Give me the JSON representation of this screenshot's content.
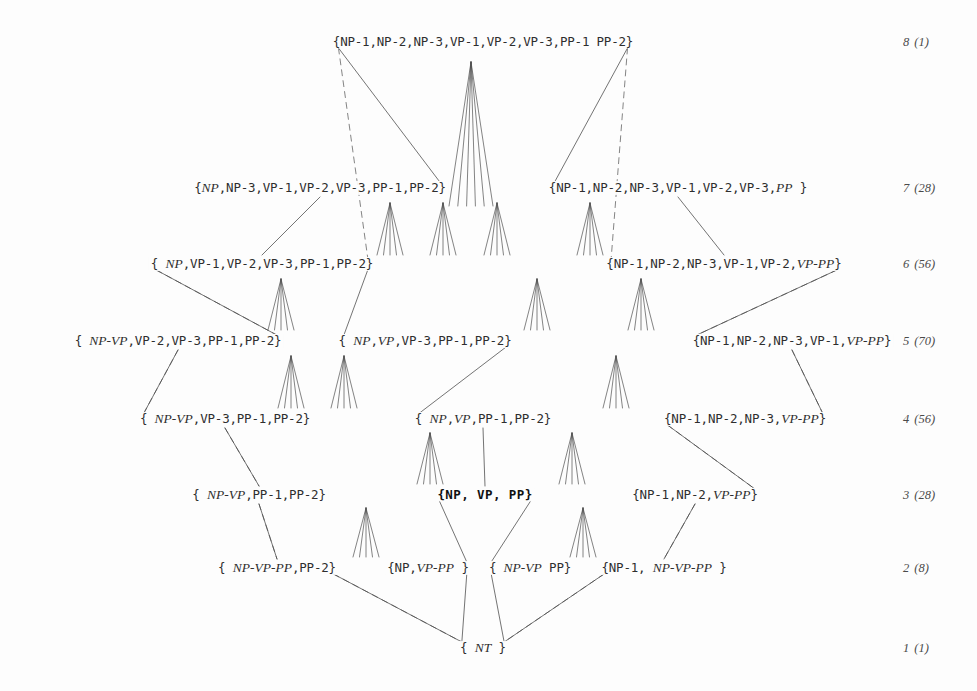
{
  "diagram": {
    "width": 977,
    "height": 691,
    "background": "#fdfdfd",
    "edge_color": "#4a4a4a",
    "fan_color": "#3a3a3a",
    "levels": [
      {
        "id": "l8",
        "number": "8",
        "count": "(1)",
        "y": 42
      },
      {
        "id": "l7",
        "number": "7",
        "count": "(28)",
        "y": 188
      },
      {
        "id": "l6",
        "number": "6",
        "count": "(56)",
        "y": 264
      },
      {
        "id": "l5",
        "number": "5",
        "count": "(70)",
        "y": 341
      },
      {
        "id": "l4",
        "number": "4",
        "count": "(56)",
        "y": 419
      },
      {
        "id": "l3",
        "number": "3",
        "count": "(28)",
        "y": 495
      },
      {
        "id": "l2",
        "number": "2",
        "count": "(8)",
        "y": 568
      },
      {
        "id": "l1",
        "number": "1",
        "count": "(1)",
        "y": 648
      }
    ],
    "level_label_x": 903,
    "nodes": [
      {
        "id": "n8",
        "x": 483,
        "y": 42,
        "level": 8,
        "bold": false,
        "html": "{NP-1,NP-2,NP-3,VP-1,VP-2,VP-3,PP-1 PP-2}",
        "text": "{NP-1,NP-2,NP-3,VP-1,VP-2,VP-3,PP-1 PP-2}"
      },
      {
        "id": "n7a",
        "x": 320,
        "y": 188,
        "level": 7,
        "bold": false,
        "html": "{<span class=\"it\">NP</span>,NP-3,VP-1,VP-2,VP-3,PP-1,PP-2}",
        "text": "{NP,NP-3,VP-1,VP-2,VP-3,PP-1,PP-2}"
      },
      {
        "id": "n7b",
        "x": 678,
        "y": 188,
        "level": 7,
        "bold": false,
        "html": "{NP-1,NP-2,NP-3,VP-1,VP-2,VP-3,<span class=\"it\">PP</span> }",
        "text": "{NP-1,NP-2,NP-3,VP-1,VP-2,VP-3,PP }"
      },
      {
        "id": "n6a",
        "x": 262,
        "y": 264,
        "level": 6,
        "bold": false,
        "html": "{ <span class=\"it\">NP</span>,VP-1,VP-2,VP-3,PP-1,PP-2}",
        "text": "{ NP,VP-1,VP-2,VP-3,PP-1,PP-2}"
      },
      {
        "id": "n6b",
        "x": 724,
        "y": 264,
        "level": 6,
        "bold": false,
        "html": "{NP-1,NP-2,NP-3,VP-1,VP-2,<span class=\"it\">VP-PP</span>}",
        "text": "{NP-1,NP-2,NP-3,VP-1,VP-2,VP-PP}"
      },
      {
        "id": "n5a",
        "x": 178,
        "y": 341,
        "level": 5,
        "bold": false,
        "html": "{ <span class=\"it\">NP-VP</span>,VP-2,VP-3,PP-1,PP-2}",
        "text": "{ NP-VP,VP-2,VP-3,PP-1,PP-2}"
      },
      {
        "id": "n5b",
        "x": 425,
        "y": 341,
        "level": 5,
        "bold": false,
        "html": "{ <span class=\"it\">NP</span>,<span class=\"it\">VP</span>,VP-3,PP-1,PP-2}",
        "text": "{ NP,VP,VP-3,PP-1,PP-2}"
      },
      {
        "id": "n5c",
        "x": 792,
        "y": 341,
        "level": 5,
        "bold": false,
        "html": "{NP-1,NP-2,NP-3,VP-1,<span class=\"it\">VP-PP</span>}",
        "text": "{NP-1,NP-2,NP-3,VP-1,VP-PP}"
      },
      {
        "id": "n4a",
        "x": 225,
        "y": 419,
        "level": 4,
        "bold": false,
        "html": "{ <span class=\"it\">NP-VP</span>,VP-3,PP-1,PP-2}",
        "text": "{ NP-VP,VP-3,PP-1,PP-2}"
      },
      {
        "id": "n4b",
        "x": 483,
        "y": 419,
        "level": 4,
        "bold": false,
        "html": "{ <span class=\"it\">NP</span>,<span class=\"it\">VP</span>,PP-1,PP-2}",
        "text": "{ NP,VP,PP-1,PP-2}"
      },
      {
        "id": "n4c",
        "x": 745,
        "y": 419,
        "level": 4,
        "bold": false,
        "html": "{NP-1,NP-2,NP-3,<span class=\"it\">VP-PP</span>}",
        "text": "{NP-1,NP-2,NP-3,VP-PP}"
      },
      {
        "id": "n3a",
        "x": 259,
        "y": 495,
        "level": 3,
        "bold": false,
        "html": "{ <span class=\"it\">NP-VP</span>,PP-1,PP-2}",
        "text": "{ NP-VP,PP-1,PP-2}"
      },
      {
        "id": "n3b",
        "x": 485,
        "y": 495,
        "level": 3,
        "bold": true,
        "html": "{NP, VP, PP}",
        "text": "{NP, VP, PP}"
      },
      {
        "id": "n3c",
        "x": 695,
        "y": 495,
        "level": 3,
        "bold": false,
        "html": "{NP-1,NP-2,<span class=\"it\">VP-PP</span>}",
        "text": "{NP-1,NP-2,VP-PP}"
      },
      {
        "id": "n2a",
        "x": 277,
        "y": 568,
        "level": 2,
        "bold": false,
        "html": "{ <span class=\"it\">NP-VP-PP</span>,PP-2}",
        "text": "{ NP-VP-PP,PP-2}"
      },
      {
        "id": "n2b",
        "x": 428,
        "y": 568,
        "level": 2,
        "bold": false,
        "html": "{NP,<span class=\"it\">VP-PP</span> }",
        "text": "{NP,VP-PP }"
      },
      {
        "id": "n2c",
        "x": 530,
        "y": 568,
        "level": 2,
        "bold": false,
        "html": "{ <span class=\"it\">NP-VP</span> PP}",
        "text": "{ NP-VP PP}"
      },
      {
        "id": "n2d",
        "x": 664,
        "y": 568,
        "level": 2,
        "bold": false,
        "html": "{NP-1, <span class=\"it\">NP-VP-PP</span> }",
        "text": "{NP-1, NP-VP-PP }"
      },
      {
        "id": "n1",
        "x": 483,
        "y": 648,
        "level": 1,
        "bold": false,
        "html": "{ <span class=\"it\">NT</span> }",
        "text": "{ NT }"
      }
    ],
    "solid_edges": [
      [
        "n8",
        "n7a"
      ],
      [
        "n8",
        "n7b"
      ],
      [
        "n7a",
        "n6a"
      ],
      [
        "n7b",
        "n6b"
      ],
      [
        "n6a",
        "n5a"
      ],
      [
        "n6b",
        "n5c"
      ],
      [
        "n5a",
        "n4a"
      ],
      [
        "n5c",
        "n4c"
      ],
      [
        "n4a",
        "n3a"
      ],
      [
        "n4c",
        "n3c"
      ],
      [
        "n3a",
        "n2a"
      ],
      [
        "n3c",
        "n2d"
      ],
      [
        "n2a",
        "n1"
      ],
      [
        "n2d",
        "n1"
      ],
      [
        "n6a",
        "n5b"
      ],
      [
        "n5b",
        "n4b"
      ],
      [
        "n4b",
        "n3b"
      ],
      [
        "n3b",
        "n2b"
      ],
      [
        "n3b",
        "n2c"
      ],
      [
        "n2b",
        "n1"
      ],
      [
        "n2c",
        "n1"
      ]
    ],
    "dashed_edges": [
      [
        "n8",
        "n6a"
      ],
      [
        "n8",
        "n6b"
      ],
      [
        "n6a",
        "n5a"
      ],
      [
        "n6b",
        "n5c"
      ],
      [
        "n5a",
        "n4a"
      ],
      [
        "n5c",
        "n4c"
      ],
      [
        "n4a",
        "n3a"
      ],
      [
        "n4c",
        "n3c"
      ],
      [
        "n3a",
        "n2a"
      ],
      [
        "n3c",
        "n2d"
      ],
      [
        "n2a",
        "n1"
      ],
      [
        "n2d",
        "n1"
      ]
    ],
    "fans": [
      {
        "id": "f1",
        "x": 471,
        "y": 206,
        "apex_y": 62,
        "w": 22,
        "n": 6
      },
      {
        "id": "f2",
        "x": 497,
        "y": 255,
        "apex_y": 203,
        "w": 13,
        "n": 5
      },
      {
        "id": "f3",
        "x": 443,
        "y": 255,
        "apex_y": 203,
        "w": 13,
        "n": 5
      },
      {
        "id": "f4",
        "x": 390,
        "y": 255,
        "apex_y": 203,
        "w": 13,
        "n": 5
      },
      {
        "id": "f5",
        "x": 590,
        "y": 255,
        "apex_y": 203,
        "w": 13,
        "n": 5
      },
      {
        "id": "f6",
        "x": 281,
        "y": 330,
        "apex_y": 279,
        "w": 13,
        "n": 5
      },
      {
        "id": "f7",
        "x": 537,
        "y": 330,
        "apex_y": 279,
        "w": 13,
        "n": 5
      },
      {
        "id": "f8",
        "x": 641,
        "y": 330,
        "apex_y": 279,
        "w": 13,
        "n": 5
      },
      {
        "id": "f9",
        "x": 291,
        "y": 408,
        "apex_y": 356,
        "w": 13,
        "n": 5
      },
      {
        "id": "f10",
        "x": 344,
        "y": 408,
        "apex_y": 356,
        "w": 13,
        "n": 5
      },
      {
        "id": "f11",
        "x": 616,
        "y": 408,
        "apex_y": 356,
        "w": 13,
        "n": 5
      },
      {
        "id": "f12",
        "x": 430,
        "y": 484,
        "apex_y": 433,
        "w": 13,
        "n": 5
      },
      {
        "id": "f13",
        "x": 572,
        "y": 484,
        "apex_y": 433,
        "w": 13,
        "n": 5
      },
      {
        "id": "f14",
        "x": 366,
        "y": 557,
        "apex_y": 508,
        "w": 13,
        "n": 5
      },
      {
        "id": "f15",
        "x": 583,
        "y": 557,
        "apex_y": 508,
        "w": 13,
        "n": 5
      }
    ]
  }
}
